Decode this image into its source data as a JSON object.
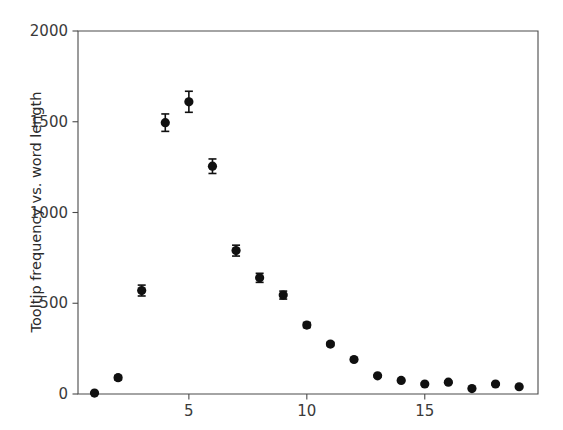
{
  "chart_data": {
    "type": "scatter",
    "title": "",
    "subtitle": "",
    "xlabel": "",
    "ylabel": "Tooltip frequency vs. word length",
    "xlim": [
      0.3,
      19.8
    ],
    "ylim": [
      0,
      2000
    ],
    "grid": false,
    "legend": null,
    "marker": "filled-circle",
    "marker_color": "#101010",
    "errorbars": "vertical, symmetric, with caps",
    "x": [
      1,
      2,
      3,
      4,
      5,
      6,
      7,
      8,
      9,
      10,
      11,
      12,
      13,
      14,
      15,
      16,
      17,
      18,
      19
    ],
    "values": [
      5,
      90,
      570,
      1495,
      1610,
      1255,
      790,
      640,
      545,
      380,
      275,
      190,
      100,
      75,
      55,
      65,
      30,
      55,
      40
    ],
    "errors": [
      3,
      12,
      30,
      48,
      58,
      40,
      30,
      25,
      22,
      14,
      10,
      8,
      6,
      5,
      5,
      5,
      4,
      5,
      4
    ],
    "xticks": [
      5,
      10,
      15
    ],
    "xtick_labels": [
      "5",
      "10",
      "15"
    ],
    "yticks": [
      0,
      500,
      1000,
      1500,
      2000
    ],
    "ytick_labels": [
      "0",
      "500",
      "1000",
      "1500",
      "2000"
    ]
  },
  "axes": {
    "y_axis_title": "Tooltip frequency vs. word length",
    "x_axis_title": ""
  }
}
